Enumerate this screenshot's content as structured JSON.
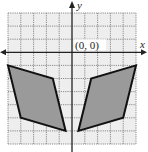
{
  "diagram": {
    "type": "coordinate-grid",
    "axes": {
      "x_label": "x",
      "y_label": "y",
      "origin_label": "(0, 0)"
    },
    "grid": {
      "x_min": -5,
      "x_max": 5,
      "y_min": -7,
      "y_max": 3,
      "step": 1,
      "style": "dotted"
    },
    "colors": {
      "grid": "#8a8a8a",
      "grid_bg": "#eeeeee",
      "axis": "#222222",
      "shape_fill": "#9a9a9a",
      "shape_stroke": "#111111"
    },
    "shapes": [
      {
        "name": "left-quadrilateral",
        "vertices": [
          [
            -5,
            -1
          ],
          [
            -1.5,
            -2
          ],
          [
            -0.5,
            -6
          ],
          [
            -4,
            -5
          ]
        ]
      },
      {
        "name": "right-quadrilateral",
        "vertices": [
          [
            5,
            -1
          ],
          [
            1.5,
            -2
          ],
          [
            0.5,
            -6
          ],
          [
            4,
            -5
          ]
        ]
      }
    ]
  }
}
